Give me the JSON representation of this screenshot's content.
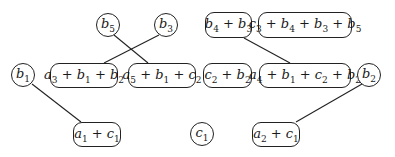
{
  "diagram": {
    "nodes": [
      {
        "id": "b5",
        "label": "b5",
        "shape": "circle",
        "x": 96,
        "y": 13,
        "w": 24,
        "h": 24
      },
      {
        "id": "b3",
        "label": "b3",
        "shape": "circle",
        "x": 154,
        "y": 13,
        "w": 24,
        "h": 24
      },
      {
        "id": "b4b3",
        "label": "b4 + b3",
        "shape": "rounded-box",
        "x": 205,
        "y": 12,
        "w": 47,
        "h": 26
      },
      {
        "id": "c3b4b3b5",
        "label": "c3 + b4 + b3 + b5",
        "shape": "rounded-box",
        "x": 258,
        "y": 12,
        "w": 94,
        "h": 26
      },
      {
        "id": "b1",
        "label": "b1",
        "shape": "circle",
        "x": 11,
        "y": 63,
        "w": 24,
        "h": 24
      },
      {
        "id": "a3b1b2",
        "label": "a3 + b1 + b2",
        "shape": "rounded-box",
        "x": 50,
        "y": 63,
        "w": 68,
        "h": 25
      },
      {
        "id": "a5b1c2",
        "label": "a5 + b1 + c2",
        "shape": "rounded-box",
        "x": 128,
        "y": 63,
        "w": 68,
        "h": 25
      },
      {
        "id": "c2b2",
        "label": "c2 + b2",
        "shape": "rounded-box",
        "x": 203,
        "y": 63,
        "w": 49,
        "h": 25
      },
      {
        "id": "a4b1c2b2",
        "label": "a4 + b1 + c2 + b2",
        "shape": "rounded-box",
        "x": 259,
        "y": 63,
        "w": 92,
        "h": 25
      },
      {
        "id": "b2",
        "label": "b2",
        "shape": "circle",
        "x": 357,
        "y": 63,
        "w": 24,
        "h": 24
      },
      {
        "id": "a1c1",
        "label": "a1 + c1",
        "shape": "rounded-box",
        "x": 73,
        "y": 122,
        "w": 48,
        "h": 25
      },
      {
        "id": "c1",
        "label": "c1",
        "shape": "circle",
        "x": 190,
        "y": 122,
        "w": 24,
        "h": 24
      },
      {
        "id": "a2c1",
        "label": "a2 + c1",
        "shape": "rounded-box",
        "x": 252,
        "y": 122,
        "w": 48,
        "h": 25
      }
    ],
    "edges": [
      {
        "from": "b5",
        "to": "a5b1c2",
        "x1": 114,
        "y1": 35,
        "x2": 148,
        "y2": 63
      },
      {
        "from": "b3",
        "to": "a3b1b2",
        "x1": 159,
        "y1": 35,
        "x2": 104,
        "y2": 63
      },
      {
        "from": "b4b3",
        "to": "a4b1c2b2",
        "x1": 244,
        "y1": 38,
        "x2": 290,
        "y2": 63
      },
      {
        "from": "b1",
        "to": "a1c1",
        "x1": 32,
        "y1": 84,
        "x2": 81,
        "y2": 122
      },
      {
        "from": "b2",
        "to": "a2c1",
        "x1": 362,
        "y1": 84,
        "x2": 296,
        "y2": 122
      }
    ],
    "labels_rich": {
      "b5": [
        "b",
        "5"
      ],
      "b3": [
        "b",
        "3"
      ],
      "b4b3": [
        [
          "b",
          "4"
        ],
        [
          "b",
          "3"
        ]
      ],
      "c3b4b3b5": [
        [
          "c",
          "3"
        ],
        [
          "b",
          "4"
        ],
        [
          "b",
          "3"
        ],
        [
          "b",
          "5"
        ]
      ],
      "b1": [
        "b",
        "1"
      ],
      "a3b1b2": [
        [
          "a",
          "3"
        ],
        [
          "b",
          "1"
        ],
        [
          "b",
          "2"
        ]
      ],
      "a5b1c2": [
        [
          "a",
          "5"
        ],
        [
          "b",
          "1"
        ],
        [
          "c",
          "2"
        ]
      ],
      "c2b2": [
        [
          "c",
          "2"
        ],
        [
          "b",
          "2"
        ]
      ],
      "a4b1c2b2": [
        [
          "a",
          "4"
        ],
        [
          "b",
          "1"
        ],
        [
          "c",
          "2"
        ],
        [
          "b",
          "2"
        ]
      ],
      "b2": [
        "b",
        "2"
      ],
      "a1c1": [
        [
          "a",
          "1"
        ],
        [
          "c",
          "1"
        ]
      ],
      "c1": [
        "c",
        "1"
      ],
      "a2c1": [
        [
          "a",
          "2"
        ],
        [
          "c",
          "1"
        ]
      ]
    },
    "line_color": "#222222"
  }
}
